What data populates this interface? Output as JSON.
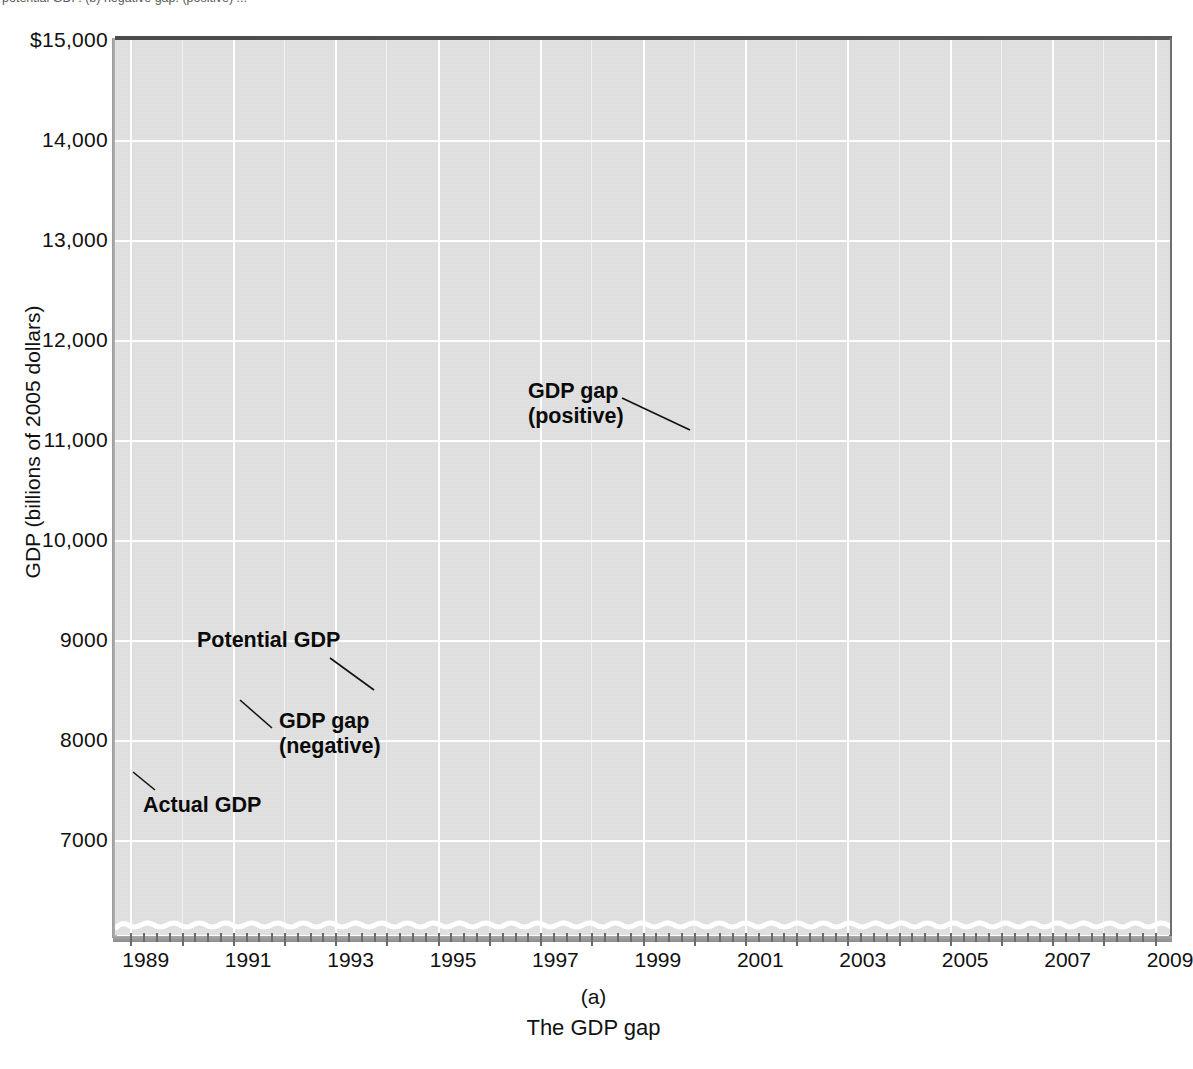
{
  "figure": {
    "clipped_header": "potential GDP. (b) negative gap. (positive) ...",
    "panel_letter": "(a)",
    "panel_title": "The GDP gap"
  },
  "axes": {
    "y_title": "GDP (billions of 2005 dollars)",
    "y_ticks": [
      "$15,000",
      "14,000",
      "13,000",
      "12,000",
      "11,000",
      "10,000",
      "9000",
      "8000",
      "7000"
    ],
    "y_tick_values": [
      15000,
      14000,
      13000,
      12000,
      11000,
      10000,
      9000,
      8000,
      7000
    ],
    "x_ticks": [
      "1989",
      "1991",
      "1993",
      "1995",
      "1997",
      "1999",
      "2001",
      "2003",
      "2005",
      "2007",
      "2009"
    ],
    "x_tick_values": [
      1989,
      1991,
      1993,
      1995,
      1997,
      1999,
      2001,
      2003,
      2005,
      2007,
      2009
    ]
  },
  "annotations": {
    "potential_gdp": "Potential GDP",
    "actual_gdp": "Actual GDP",
    "gap_negative_line1": "GDP gap",
    "gap_negative_line2": "(negative)",
    "gap_positive_line1": "GDP gap",
    "gap_positive_line2": "(positive)"
  },
  "colors": {
    "plot_background": "#dcdcdc",
    "gridline": "#ffffff",
    "actual_gdp_line": "#333333",
    "potential_gdp_line": "#6e6e6e",
    "gap_fill": "#c5c5c5",
    "axis_rule": "#4b4b4b",
    "text": "#111111"
  },
  "chart_data": {
    "type": "line",
    "title": "The GDP gap",
    "xlabel": "",
    "ylabel": "GDP (billions of 2005 dollars)",
    "xlim": [
      1988.7,
      2009.3
    ],
    "ylim": [
      7000,
      15000
    ],
    "grid": true,
    "legend": "inline annotations",
    "x": [
      1989,
      1989.5,
      1990,
      1990.5,
      1991,
      1991.5,
      1992,
      1992.5,
      1993,
      1993.5,
      1994,
      1994.5,
      1995,
      1995.5,
      1996,
      1996.5,
      1997,
      1997.5,
      1998,
      1998.5,
      1999,
      1999.5,
      2000,
      2000.5,
      2001,
      2001.5,
      2002,
      2002.5,
      2003,
      2003.5,
      2004,
      2004.5,
      2005,
      2005.5,
      2006,
      2006.5,
      2007,
      2007.5,
      2008,
      2008.5,
      2009
    ],
    "series": [
      {
        "name": "Actual GDP",
        "color": "#333333",
        "values": [
          7730,
          7880,
          8020,
          8030,
          7960,
          7990,
          8120,
          8230,
          8330,
          8400,
          8560,
          8700,
          8800,
          8840,
          8980,
          9150,
          9320,
          9480,
          9680,
          9890,
          10080,
          10300,
          10530,
          10690,
          10730,
          10790,
          10950,
          11050,
          11150,
          11420,
          11620,
          11790,
          11970,
          12150,
          12350,
          12530,
          12720,
          12930,
          13030,
          12880,
          12860
        ],
        "notes": "Thick dark line; dips below potential 1990-1996 and again 2002-2004 and 2008-2009"
      },
      {
        "name": "Potential GDP",
        "color": "#6e6e6e",
        "values": [
          7800,
          7925,
          8050,
          8160,
          8270,
          8375,
          8480,
          8590,
          8700,
          8810,
          8920,
          9030,
          9140,
          9250,
          9360,
          9480,
          9600,
          9730,
          9860,
          9995,
          10130,
          10275,
          10420,
          10575,
          10730,
          10890,
          11050,
          11215,
          11380,
          11545,
          11710,
          11880,
          12050,
          12220,
          12390,
          12560,
          12730,
          12900,
          13070,
          13240,
          13400
        ],
        "notes": "Smooth upward-sloping medium-gray line"
      }
    ],
    "gap_regions": [
      {
        "label": "GDP gap (negative)",
        "start": 1990.3,
        "end": 1997.0,
        "sign": "negative"
      },
      {
        "label": "GDP gap (positive)",
        "start": 1997.2,
        "end": 2001.6,
        "sign": "positive"
      },
      {
        "label": "GDP gap (negative)",
        "start": 2001.6,
        "end": 2005.2,
        "sign": "negative"
      },
      {
        "label": "GDP gap (negative)",
        "start": 2007.4,
        "end": 2009.0,
        "sign": "negative"
      }
    ]
  }
}
